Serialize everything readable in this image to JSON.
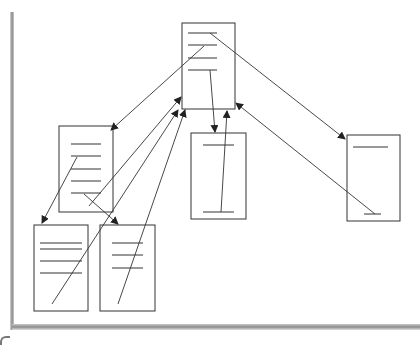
{
  "diagram": {
    "type": "document-hierarchy",
    "colors": {
      "stroke": "#333333",
      "box_fill": "#ffffff",
      "shadow": "#8a8a8a"
    },
    "nodes": [
      {
        "id": "top",
        "x": 182,
        "y": 23,
        "w": 53,
        "h": 86,
        "lines": [
          [
            188,
            33,
            217,
            33
          ],
          [
            188,
            45,
            217,
            45
          ],
          [
            188,
            58,
            217,
            58
          ],
          [
            188,
            70,
            217,
            70
          ]
        ]
      },
      {
        "id": "left",
        "x": 59,
        "y": 126,
        "w": 54,
        "h": 86,
        "lines": [
          [
            71,
            144,
            101,
            144
          ],
          [
            71,
            156,
            101,
            156
          ],
          [
            71,
            169,
            101,
            169
          ],
          [
            71,
            181,
            101,
            181
          ],
          [
            71,
            193,
            101,
            193
          ]
        ]
      },
      {
        "id": "middle",
        "x": 191,
        "y": 133,
        "w": 55,
        "h": 86,
        "lines": [
          [
            203,
            145,
            234,
            145
          ],
          [
            203,
            212,
            234,
            212
          ]
        ]
      },
      {
        "id": "right",
        "x": 347,
        "y": 135,
        "w": 53,
        "h": 86,
        "lines": [
          [
            353,
            147,
            388,
            147
          ],
          [
            364,
            214,
            381,
            214
          ]
        ]
      },
      {
        "id": "bottom-left",
        "x": 34,
        "y": 225,
        "w": 54,
        "h": 86,
        "lines": [
          [
            40,
            243,
            82,
            243
          ],
          [
            40,
            249,
            82,
            249
          ],
          [
            40,
            261,
            82,
            261
          ],
          [
            40,
            273,
            82,
            273
          ]
        ]
      },
      {
        "id": "bottom-mid",
        "x": 100,
        "y": 225,
        "w": 55,
        "h": 86,
        "lines": [
          [
            112,
            243,
            143,
            243
          ],
          [
            112,
            255,
            143,
            255
          ],
          [
            112,
            268,
            143,
            268
          ]
        ]
      }
    ],
    "edges": [
      {
        "from": [
          204,
          46
        ],
        "to": [
          111,
          130
        ],
        "heads": [
          "end"
        ]
      },
      {
        "from": [
          210,
          33
        ],
        "to": [
          345,
          139
        ],
        "heads": [
          "end"
        ]
      },
      {
        "from": [
          210,
          70
        ],
        "to": [
          215,
          132
        ],
        "heads": [
          "end"
        ]
      },
      {
        "from": [
          221,
          212
        ],
        "to": [
          227,
          111
        ],
        "heads": [
          "end"
        ]
      },
      {
        "from": [
          375,
          214
        ],
        "to": [
          236,
          103
        ],
        "heads": [
          "end"
        ]
      },
      {
        "from": [
          77,
          157
        ],
        "to": [
          42,
          223
        ],
        "heads": [
          "end"
        ]
      },
      {
        "from": [
          84,
          194
        ],
        "to": [
          118,
          224
        ],
        "heads": [
          "end"
        ]
      },
      {
        "from": [
          89,
          206
        ],
        "to": [
          181,
          97
        ],
        "heads": [
          "end"
        ]
      },
      {
        "from": [
          52,
          304
        ],
        "to": [
          178,
          110
        ],
        "heads": [
          "end"
        ]
      },
      {
        "from": [
          118,
          304
        ],
        "to": [
          185,
          110
        ],
        "heads": [
          "end"
        ]
      }
    ]
  }
}
